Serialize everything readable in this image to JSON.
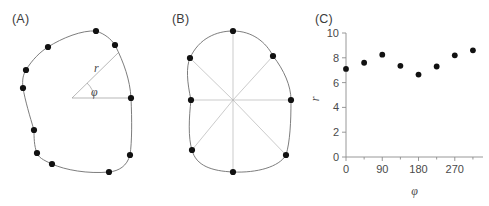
{
  "figure": {
    "panels": [
      {
        "id": "A",
        "label": "(A)"
      },
      {
        "id": "B",
        "label": "(B)"
      },
      {
        "id": "C",
        "label": "(C)"
      }
    ]
  },
  "panel_a": {
    "label": "(A)",
    "radius_label": "r",
    "angle_label": "φ",
    "center": {
      "x": 72,
      "y": 98
    },
    "outline_points": [
      {
        "x": 96,
        "y": 31
      },
      {
        "x": 115,
        "y": 45
      },
      {
        "x": 131,
        "y": 98
      },
      {
        "x": 130,
        "y": 155
      },
      {
        "x": 109,
        "y": 172
      },
      {
        "x": 52,
        "y": 164
      },
      {
        "x": 37,
        "y": 153
      },
      {
        "x": 34,
        "y": 130
      },
      {
        "x": 23,
        "y": 88
      },
      {
        "x": 26,
        "y": 70
      },
      {
        "x": 48,
        "y": 47
      }
    ]
  },
  "panel_b": {
    "label": "(B)",
    "center": {
      "x": 73,
      "y": 100
    },
    "vertices": [
      {
        "angle": 0,
        "x": 131,
        "y": 100
      },
      {
        "angle": 45,
        "x": 113,
        "y": 56
      },
      {
        "angle": 90,
        "x": 73,
        "y": 31
      },
      {
        "angle": 135,
        "x": 30,
        "y": 58
      },
      {
        "angle": 180,
        "x": 31,
        "y": 100
      },
      {
        "angle": 225,
        "x": 32,
        "y": 150
      },
      {
        "angle": 270,
        "x": 73,
        "y": 172
      },
      {
        "angle": 315,
        "x": 126,
        "y": 155
      }
    ]
  },
  "chart_data": {
    "type": "scatter",
    "title": "",
    "xlabel": "φ",
    "ylabel": "r",
    "x": [
      0,
      45,
      90,
      135,
      180,
      225,
      270,
      315
    ],
    "values": [
      7.1,
      7.6,
      8.25,
      7.35,
      6.65,
      7.3,
      8.2,
      8.6
    ],
    "xlim": [
      0,
      340
    ],
    "ylim": [
      0,
      10
    ],
    "xticks": [
      0,
      90,
      180,
      270
    ],
    "xtick_labels": [
      "0",
      "90",
      "180",
      "270"
    ],
    "xminor_ticks": [
      45,
      135,
      225,
      315
    ],
    "yticks": [
      0,
      2,
      4,
      6,
      8,
      10
    ],
    "ytick_labels": [
      "0",
      "2",
      "4",
      "6",
      "8",
      "10"
    ],
    "grid": false,
    "legend": null
  }
}
